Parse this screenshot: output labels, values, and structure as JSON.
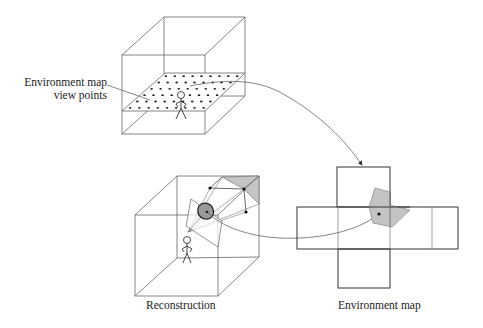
{
  "labels": {
    "viewpoints_line1": "Environment map",
    "viewpoints_line2": "view points",
    "reconstruction": "Reconstruction",
    "environment_map": "Environment map"
  },
  "colors": {
    "line": "#555555",
    "dark_line": "#333333",
    "gray_fill": "#c4c4c4",
    "dot": "#222222",
    "background": "#ffffff"
  },
  "diagram": {
    "top_cube": {
      "description": "Room volume with a grid of environment map view points on a horizontal plane and a stick figure",
      "grid_rows": 6,
      "grid_cols": 9
    },
    "bottom_cube": {
      "description": "Reconstruction: stick figure viewer, projection plane with a highlighted blob, rays to a gray polygon on the cube surface"
    },
    "environment_map": {
      "description": "Unfolded cube cross with a gray polygon patch and a sample point"
    },
    "arrows": [
      {
        "from": "environment map view points",
        "to": "environment map",
        "style": "curved arrow"
      },
      {
        "from": "reconstruction blob",
        "to": "environment map sample point",
        "style": "curved line"
      }
    ]
  }
}
